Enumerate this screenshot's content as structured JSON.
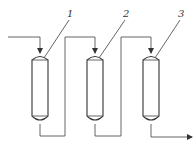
{
  "diagram": {
    "type": "process-flow",
    "columns": [
      {
        "id": "column-1",
        "label": "1"
      },
      {
        "id": "column-2",
        "label": "2"
      },
      {
        "id": "column-3",
        "label": "3"
      }
    ],
    "streams": [
      {
        "from": "feed",
        "to": "column-1"
      },
      {
        "from": "column-1",
        "to": "column-2"
      },
      {
        "from": "column-2",
        "to": "column-3"
      },
      {
        "from": "column-3",
        "to": "outlet"
      }
    ]
  }
}
